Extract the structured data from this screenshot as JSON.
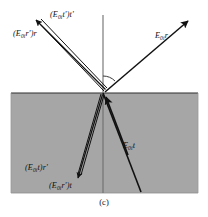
{
  "figure": {
    "caption": "(c)",
    "interface": {
      "medium_fill_color": "#a6a6a6",
      "medium_border_color": "#2b2b2b",
      "line_color": "#1a1a1a",
      "normal_line_color": "#6e6e6e",
      "background_color": "#ffffff"
    },
    "labels": [
      {
        "id": "label-incident-reflected",
        "name": "label-E0i-r",
        "text_parts": {
          "pre": "E",
          "sub": "0i",
          "post": "r"
        },
        "plain": "E0ir",
        "x": 155,
        "y": 36
      },
      {
        "id": "label-transmitted",
        "name": "label-E0i-t",
        "text_parts": {
          "pre": "E",
          "sub": "0i",
          "post": "t"
        },
        "plain": "E0it",
        "x": 123,
        "y": 146
      },
      {
        "id": "label-upper-tt",
        "name": "label-E0i-t-prime-t-prime",
        "text_parts": {
          "pre": "(E",
          "sub": "0i",
          "post": "t')t'"
        },
        "plain": "(E0it')t'",
        "x": 52,
        "y": 14
      },
      {
        "id": "label-upper-rr",
        "name": "label-E0i-r-prime-r",
        "text_parts": {
          "pre": "(E",
          "sub": "0i",
          "post": "r')r"
        },
        "plain": "(E0ir')r",
        "x": 14,
        "y": 32
      },
      {
        "id": "label-lower-tr",
        "name": "label-E0i-t-r-prime",
        "text_parts": {
          "pre": "(E",
          "sub": "0i",
          "post": "t)r'"
        },
        "plain": "(E0it)r'",
        "x": 26,
        "y": 167
      },
      {
        "id": "label-lower-rt",
        "name": "label-E0i-r-prime-t",
        "text_parts": {
          "pre": "(E",
          "sub": "0i",
          "post": "r')t"
        },
        "plain": "(E0ir')t",
        "x": 50,
        "y": 184
      }
    ],
    "rays": [
      {
        "name": "incident-reflected-ray",
        "from": [
          103,
          93
        ],
        "to": [
          188,
          20
        ],
        "arrow_at": "to",
        "style": "single"
      },
      {
        "name": "transmitted-ray",
        "from": [
          141,
          192
        ],
        "to": [
          103,
          93
        ],
        "arrow_at": "to",
        "style": "single"
      },
      {
        "name": "internal-downward-ray",
        "from": [
          103,
          93
        ],
        "to": [
          141,
          192
        ],
        "arrow_at": "none",
        "style": "single"
      },
      {
        "name": "upper-left-double-ray",
        "from": [
          103,
          93
        ],
        "to": [
          33,
          19
        ],
        "arrow_at": "to",
        "style": "double"
      },
      {
        "name": "lower-left-double-ray",
        "from": [
          103,
          93
        ],
        "to": [
          78,
          179
        ],
        "arrow_at": "to",
        "style": "double"
      },
      {
        "name": "normal-line",
        "from": [
          103,
          15
        ],
        "to": [
          103,
          193
        ],
        "arrow_at": "none",
        "style": "normal"
      }
    ],
    "angle_marker": {
      "name": "angle-of-incidence-arc",
      "center": [
        103,
        93
      ],
      "radius": 17
    }
  }
}
